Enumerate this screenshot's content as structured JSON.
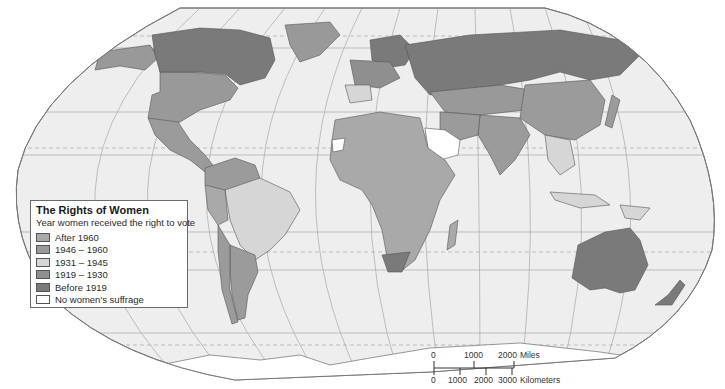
{
  "legend": {
    "title": "The Rights of Women",
    "subtitle": "Year women received the right to vote",
    "items": [
      {
        "label": "After 1960",
        "color": "#a9a9a9"
      },
      {
        "label": "1946 – 1960",
        "color": "#9b9b9b"
      },
      {
        "label": "1931 – 1945",
        "color": "#d6d6d6"
      },
      {
        "label": "1919 – 1930",
        "color": "#8f8f8f"
      },
      {
        "label": "Before 1919",
        "color": "#7a7a7a"
      },
      {
        "label": "No women's suffrage",
        "color": "#ffffff"
      }
    ]
  },
  "scale_bar": {
    "miles": {
      "ticks": [
        "0",
        "1000",
        "2000"
      ],
      "unit": "Miles"
    },
    "kilometers": {
      "ticks": [
        "0",
        "1000",
        "2000",
        "3000"
      ],
      "unit": "Kilometers"
    }
  },
  "colors": {
    "ocean": "#eeeeee",
    "graticule": "#a0a0a0",
    "border": "#555555",
    "outline": "#777777"
  }
}
